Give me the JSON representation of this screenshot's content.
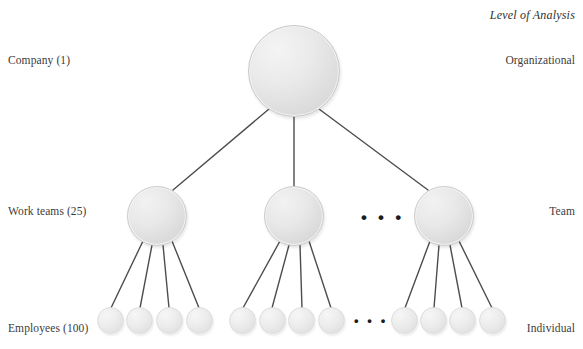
{
  "title": "Level of Analysis",
  "left_labels": [
    {
      "id": "company",
      "text": "Company (1)",
      "x": 8,
      "y": 54
    },
    {
      "id": "workteams",
      "text": "Work teams (25)",
      "x": 8,
      "y": 205
    },
    {
      "id": "employees",
      "text": "Employees (100)",
      "x": 8,
      "y": 322
    }
  ],
  "right_labels": [
    {
      "id": "organizational",
      "text": "Organizational",
      "x": 575,
      "y": 54
    },
    {
      "id": "team",
      "text": "Team",
      "x": 575,
      "y": 205
    },
    {
      "id": "individual",
      "text": "Individual",
      "x": 575,
      "y": 322
    }
  ],
  "nodes": {
    "organization": [
      {
        "id": "company-1",
        "cx": 294,
        "cy": 71,
        "r": 46
      }
    ],
    "teams": [
      {
        "id": "team-1",
        "cx": 157,
        "cy": 216,
        "r": 30
      },
      {
        "id": "team-2",
        "cx": 294,
        "cy": 216,
        "r": 30
      },
      {
        "id": "team-3",
        "cx": 444,
        "cy": 216,
        "r": 30
      }
    ],
    "employees": [
      {
        "id": "employee-1",
        "cx": 110,
        "cy": 320,
        "r": 13.5,
        "team": "team-1"
      },
      {
        "id": "employee-2",
        "cx": 139,
        "cy": 320,
        "r": 13.5,
        "team": "team-1"
      },
      {
        "id": "employee-3",
        "cx": 169,
        "cy": 320,
        "r": 13.5,
        "team": "team-1"
      },
      {
        "id": "employee-4",
        "cx": 199,
        "cy": 320,
        "r": 13.5,
        "team": "team-1"
      },
      {
        "id": "employee-5",
        "cx": 242,
        "cy": 320,
        "r": 13.5,
        "team": "team-2"
      },
      {
        "id": "employee-6",
        "cx": 272,
        "cy": 320,
        "r": 13.5,
        "team": "team-2"
      },
      {
        "id": "employee-7",
        "cx": 301,
        "cy": 320,
        "r": 13.5,
        "team": "team-2"
      },
      {
        "id": "employee-8",
        "cx": 331,
        "cy": 320,
        "r": 13.5,
        "team": "team-2"
      },
      {
        "id": "employee-9",
        "cx": 404,
        "cy": 320,
        "r": 13.5,
        "team": "team-3"
      },
      {
        "id": "employee-10",
        "cx": 433,
        "cy": 320,
        "r": 13.5,
        "team": "team-3"
      },
      {
        "id": "employee-11",
        "cx": 462,
        "cy": 320,
        "r": 13.5,
        "team": "team-3"
      },
      {
        "id": "employee-12",
        "cx": 492,
        "cy": 320,
        "r": 13.5,
        "team": "team-3"
      }
    ]
  },
  "edges": [
    {
      "id": "edge-company-team1",
      "x1": 269,
      "y1": 109,
      "x2": 173,
      "y2": 190
    },
    {
      "id": "edge-company-team2",
      "x1": 294,
      "y1": 117,
      "x2": 294,
      "y2": 186
    },
    {
      "id": "edge-company-team3",
      "x1": 319,
      "y1": 109,
      "x2": 428,
      "y2": 190
    },
    {
      "id": "edge-team1-emp1",
      "x1": 143,
      "y1": 241,
      "x2": 111,
      "y2": 308
    },
    {
      "id": "edge-team1-emp2",
      "x1": 152,
      "y1": 245,
      "x2": 140,
      "y2": 308
    },
    {
      "id": "edge-team1-emp3",
      "x1": 163,
      "y1": 245,
      "x2": 169,
      "y2": 308
    },
    {
      "id": "edge-team1-emp4",
      "x1": 172,
      "y1": 241,
      "x2": 199,
      "y2": 308
    },
    {
      "id": "edge-team2-emp5",
      "x1": 280,
      "y1": 241,
      "x2": 243,
      "y2": 308
    },
    {
      "id": "edge-team2-emp6",
      "x1": 289,
      "y1": 245,
      "x2": 272,
      "y2": 308
    },
    {
      "id": "edge-team2-emp7",
      "x1": 300,
      "y1": 245,
      "x2": 302,
      "y2": 308
    },
    {
      "id": "edge-team2-emp8",
      "x1": 309,
      "y1": 241,
      "x2": 331,
      "y2": 308
    },
    {
      "id": "edge-team3-emp9",
      "x1": 430,
      "y1": 241,
      "x2": 405,
      "y2": 308
    },
    {
      "id": "edge-team3-emp10",
      "x1": 439,
      "y1": 245,
      "x2": 434,
      "y2": 308
    },
    {
      "id": "edge-team3-emp11",
      "x1": 450,
      "y1": 245,
      "x2": 462,
      "y2": 308
    },
    {
      "id": "edge-team3-emp12",
      "x1": 459,
      "y1": 241,
      "x2": 492,
      "y2": 308
    }
  ],
  "ellipses": [
    {
      "id": "ellipsis-teams",
      "text": "• • •",
      "x": 361,
      "y": 209
    },
    {
      "id": "ellipsis-employees",
      "text": "• • •",
      "x": 354,
      "y": 314
    }
  ],
  "colors": {
    "edge": "#4d4d4d",
    "node_fill_light": "#f4f4f4",
    "node_fill_dark": "#d2d2d2",
    "node_border": "#c9c9c9",
    "text": "#3a3a3a"
  }
}
